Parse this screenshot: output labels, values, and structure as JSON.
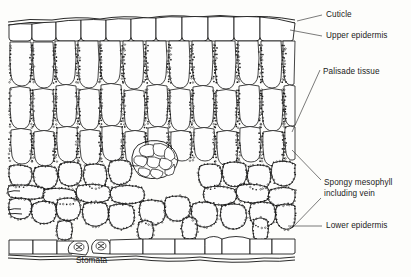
{
  "figure": {
    "type": "biological-diagram",
    "background_color": "#fdfdfb",
    "ink_color": "#111111",
    "label_font_size_px": 8.2
  },
  "labels": [
    {
      "id": "cuticle",
      "text": "Cuticle",
      "x": 326,
      "y": 14,
      "leader": {
        "from_x": 322,
        "from_y": 18,
        "to_x": 296,
        "to_y": 22
      }
    },
    {
      "id": "upper-epidermis",
      "text": "Upper epidermis",
      "x": 326,
      "y": 35,
      "leader": {
        "from_x": 322,
        "from_y": 39,
        "to_x": 290,
        "to_y": 32
      }
    },
    {
      "id": "palisade-tissue",
      "text": "Palisade tissue",
      "x": 323,
      "y": 73,
      "leader": {
        "from_x": 320,
        "from_y": 77,
        "to_x": 292,
        "to_y": 132
      }
    },
    {
      "id": "spongy-mesophyll",
      "text": "Spongy mesophyll",
      "x": 324,
      "y": 184,
      "leader": {
        "from_x": 321,
        "from_y": 190,
        "to_x": 291,
        "to_y": 150
      }
    },
    {
      "id": "spongy-mesophyll-line2",
      "text": "including vein",
      "x": 324,
      "y": 194,
      "leader": null
    },
    {
      "id": "lower-epidermis",
      "text": "Lower epidermis",
      "x": 326,
      "y": 224,
      "leader": {
        "from_x": 322,
        "from_y": 228,
        "to_x": 288,
        "to_y": 228
      }
    },
    {
      "id": "stomata",
      "text": "Stomata",
      "x": 76,
      "y": 258,
      "leader": null
    }
  ],
  "structures": [
    {
      "name": "cuticle",
      "description": "thin wavy outer layer above the upper epidermis"
    },
    {
      "name": "upper-epidermis",
      "description": "single row of large rounded box cells beneath the cuticle"
    },
    {
      "name": "palisade-tissue",
      "description": "columnar cells packed with chloroplasts, roughly three tiers deep"
    },
    {
      "name": "spongy-mesophyll",
      "description": "irregular loosely packed cells with large air spaces"
    },
    {
      "name": "vein",
      "description": "central cluster of small vascular bundle cells"
    },
    {
      "name": "lower-epidermis",
      "description": "single row of box cells at the base of the leaf"
    },
    {
      "name": "stomata",
      "description": "two pores flanked by guard cells in the lower epidermis"
    }
  ]
}
